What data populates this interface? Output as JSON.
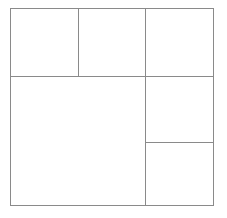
{
  "figure": {
    "background_color": "#ffffff",
    "stroke_color": "#8a8a8a",
    "stroke_width_px": 1,
    "frame": {
      "left": 10,
      "top": 8,
      "width": 204,
      "height": 198
    },
    "dividers": {
      "horizontal": [
        {
          "name": "main-horizontal-divider",
          "y": 68,
          "x_start": 0,
          "x_end": 204,
          "spans": "full-width"
        },
        {
          "name": "right-column-horizontal-divider",
          "y": 134,
          "x_start": 135,
          "x_end": 204,
          "spans": "right-column"
        }
      ],
      "vertical": [
        {
          "name": "top-row-vertical-divider",
          "x": 68,
          "y_start": 0,
          "y_end": 68,
          "spans": "top-row"
        },
        {
          "name": "full-height-vertical-divider",
          "x": 135,
          "y_start": 0,
          "y_end": 198,
          "spans": "full-height"
        }
      ]
    },
    "cells": [
      {
        "id": "cell-top-left",
        "label": "",
        "x": 0,
        "y": 0,
        "width": 68,
        "height": 68
      },
      {
        "id": "cell-top-middle",
        "label": "",
        "x": 68,
        "y": 0,
        "width": 67,
        "height": 68
      },
      {
        "id": "cell-top-right",
        "label": "",
        "x": 135,
        "y": 0,
        "width": 69,
        "height": 68
      },
      {
        "id": "cell-bottom-left-large",
        "label": "",
        "x": 0,
        "y": 68,
        "width": 135,
        "height": 130
      },
      {
        "id": "cell-right-middle",
        "label": "",
        "x": 135,
        "y": 68,
        "width": 69,
        "height": 66
      },
      {
        "id": "cell-bottom-right",
        "label": "",
        "x": 135,
        "y": 134,
        "width": 69,
        "height": 64
      }
    ],
    "cell_count": 6
  }
}
